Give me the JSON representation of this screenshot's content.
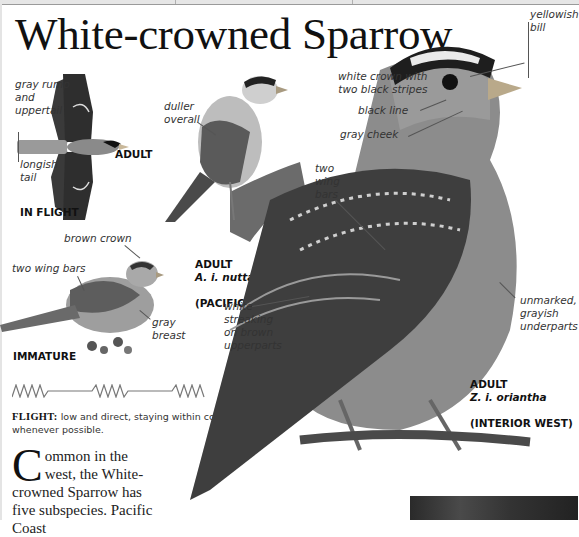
{
  "page": {
    "title": "White-crowned Sparrow"
  },
  "illustrations": {
    "in_flight": {
      "caption": "IN FLIGHT",
      "age_label": "ADULT",
      "labels": [
        "gray rump\nand\nuppertail",
        "longish\ntail"
      ]
    },
    "adult_pacific": {
      "caption_age": "ADULT",
      "caption_subspecies": "A. i. nuttalli",
      "caption_region": "(PACIFIC)",
      "labels": [
        "duller\noverall"
      ]
    },
    "immature": {
      "caption": "IMMATURE",
      "labels": [
        "brown crown",
        "two wing bars",
        "gray\nbreast"
      ]
    },
    "adult_interior_west": {
      "caption_age": "ADULT",
      "caption_subspecies": "Z. i. oriantha",
      "caption_region": "(INTERIOR WEST)",
      "labels": [
        "yellowish\nbill",
        "white crown with\ntwo black stripes",
        "black line",
        "gray cheek",
        "two\nwing\nbars",
        "white\nstreaking\non brown\nupperparts",
        "unmarked,\ngrayish\nunderparts"
      ]
    }
  },
  "flight": {
    "heading": "FLIGHT:",
    "description": " low and direct, staying within cover whenever possible."
  },
  "body": {
    "drop_cap": "C",
    "text": "ommon in the west, the White-crowned Sparrow has five subspecies. Pacific Coast"
  },
  "colors": {
    "background": "#ffffff",
    "text": "#222222",
    "leader": "#555555",
    "flight_line": "#777777"
  }
}
